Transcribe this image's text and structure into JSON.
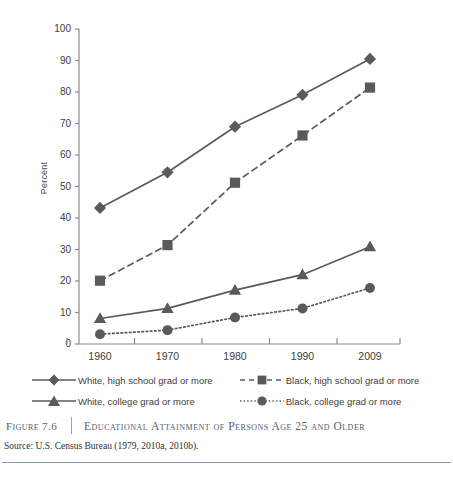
{
  "figure": {
    "number_label": "Figure 7.6",
    "title": "Educational Attainment of Persons Age 25 and Older",
    "source": "Source: U.S. Census Bureau (1979, 2010a, 2010b)."
  },
  "colors": {
    "series": "#5a5a5a",
    "axis": "#8a8a8a",
    "text": "#3d3d3d",
    "caption": "#55606b",
    "rule": "#8e99a4",
    "background": "#ffffff"
  },
  "legend": {
    "items": [
      {
        "label": "White, high school grad or more",
        "marker": "diamond-marker",
        "line": "solid"
      },
      {
        "label": "Black, high school grad or more",
        "marker": "square-marker",
        "line": "dashed"
      },
      {
        "label": "White, college grad or more",
        "marker": "triangle-marker",
        "line": "solid"
      },
      {
        "label": "Black, college grad or more",
        "marker": "circle-marker",
        "line": "dotted"
      }
    ]
  },
  "chart_data": {
    "type": "line",
    "title": "Educational Attainment of Persons Age 25 and Older",
    "xlabel": "",
    "ylabel": "Percent",
    "categories": [
      "1960",
      "1970",
      "1980",
      "1990",
      "2009"
    ],
    "ylim": [
      0,
      100
    ],
    "yticks": [
      0,
      10,
      20,
      30,
      40,
      50,
      60,
      70,
      80,
      90,
      100
    ],
    "grid": false,
    "legend_position": "below-plot",
    "series": [
      {
        "name": "White, high school grad or more",
        "marker": "diamond",
        "line": "solid",
        "values": [
          43.2,
          54.5,
          69.0,
          79.1,
          90.5
        ]
      },
      {
        "name": "Black, high school grad or more",
        "marker": "square",
        "line": "dashed",
        "values": [
          20.1,
          31.4,
          51.2,
          66.2,
          81.4
        ]
      },
      {
        "name": "White, college grad or more",
        "marker": "triangle",
        "line": "solid",
        "values": [
          8.1,
          11.3,
          17.1,
          22.0,
          30.9
        ]
      },
      {
        "name": "Black, college grad or more",
        "marker": "circle",
        "line": "dotted",
        "values": [
          3.1,
          4.4,
          8.4,
          11.3,
          17.8
        ]
      }
    ]
  }
}
